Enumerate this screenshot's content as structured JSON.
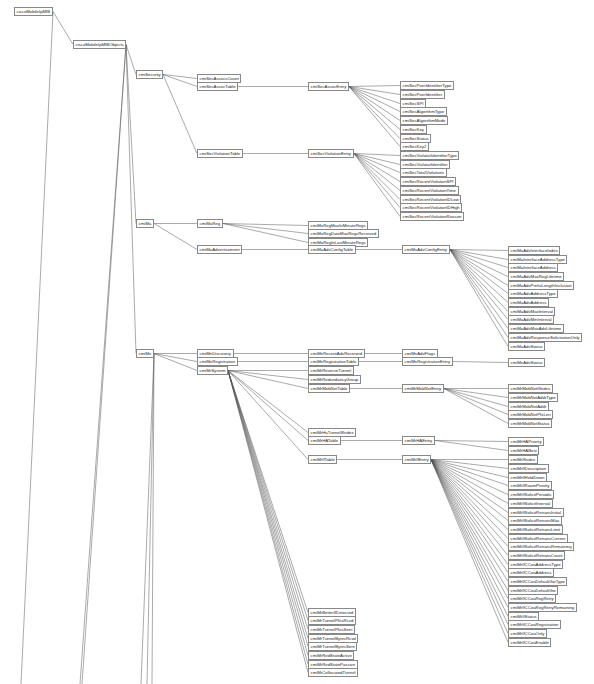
{
  "diagram": {
    "title": "ciscoMobileIpMIB",
    "line_color": "#555555",
    "node_border_color": "#888888",
    "nodes": [
      {
        "id": "root",
        "label": "ciscoMobileIpMIB",
        "x": 14,
        "y": 7,
        "parent": null
      },
      {
        "id": "objs",
        "label": "ciscoMobileIpMIBObjects",
        "x": 73,
        "y": 40,
        "parent": "root"
      },
      {
        "id": "sec",
        "label": "cmiSecurity",
        "x": 136,
        "y": 70,
        "parent": "objs"
      },
      {
        "id": "assocCount",
        "label": "cmiSecAssocsCount",
        "x": 197,
        "y": 74,
        "parent": "sec"
      },
      {
        "id": "assocTable",
        "label": "cmiSecAssocTable",
        "x": 197,
        "y": 82,
        "parent": "sec"
      },
      {
        "id": "assocEntry",
        "label": "cmiSecAssocEntry",
        "x": 308,
        "y": 82,
        "parent": "assocTable"
      },
      {
        "id": "a1",
        "label": "cmiSecPeerIdentifierType",
        "x": 400,
        "y": 81,
        "parent": "assocEntry"
      },
      {
        "id": "a2",
        "label": "cmiSecPeerIdentifier",
        "x": 400,
        "y": 90,
        "parent": "assocEntry"
      },
      {
        "id": "a3",
        "label": "cmiSecSPI",
        "x": 400,
        "y": 99,
        "parent": "assocEntry"
      },
      {
        "id": "a4",
        "label": "cmiSecAlgorithmType",
        "x": 400,
        "y": 107,
        "parent": "assocEntry"
      },
      {
        "id": "a5",
        "label": "cmiSecAlgorithmMode",
        "x": 400,
        "y": 116,
        "parent": "assocEntry"
      },
      {
        "id": "a6",
        "label": "cmiSecKey",
        "x": 400,
        "y": 125,
        "parent": "assocEntry"
      },
      {
        "id": "a7",
        "label": "cmiSecStatus",
        "x": 400,
        "y": 134,
        "parent": "assocEntry"
      },
      {
        "id": "a8",
        "label": "cmiSecKey2",
        "x": 400,
        "y": 142,
        "parent": "assocEntry"
      },
      {
        "id": "violTable",
        "label": "cmiSecViolationTable",
        "x": 197,
        "y": 149,
        "parent": "sec"
      },
      {
        "id": "violEntry",
        "label": "cmiSecViolationEntry",
        "x": 308,
        "y": 149,
        "parent": "violTable"
      },
      {
        "id": "v1",
        "label": "cmiSecViolatorIdentifierType",
        "x": 400,
        "y": 151,
        "parent": "violEntry"
      },
      {
        "id": "v2",
        "label": "cmiSecViolatorIdentifier",
        "x": 400,
        "y": 160,
        "parent": "violEntry"
      },
      {
        "id": "v3",
        "label": "cmiSecTotalViolations",
        "x": 400,
        "y": 168,
        "parent": "violEntry"
      },
      {
        "id": "v4",
        "label": "cmiSecRecentViolationSPI",
        "x": 400,
        "y": 177,
        "parent": "violEntry"
      },
      {
        "id": "v5",
        "label": "cmiSecRecentViolationTime",
        "x": 400,
        "y": 186,
        "parent": "violEntry"
      },
      {
        "id": "v6",
        "label": "cmiSecRecentViolationIDLow",
        "x": 400,
        "y": 195,
        "parent": "violEntry"
      },
      {
        "id": "v7",
        "label": "cmiSecRecentViolationIDHigh",
        "x": 400,
        "y": 203,
        "parent": "violEntry"
      },
      {
        "id": "v8",
        "label": "cmiSecRecentViolationReason",
        "x": 400,
        "y": 212,
        "parent": "violEntry"
      },
      {
        "id": "ma",
        "label": "cmiMa",
        "x": 136,
        "y": 219,
        "parent": "objs"
      },
      {
        "id": "maReg",
        "label": "cmiMaReg",
        "x": 197,
        "y": 219,
        "parent": "ma"
      },
      {
        "id": "r1",
        "label": "cmiMaRegMaxInMinuteRegs",
        "x": 308,
        "y": 221,
        "parent": "maReg"
      },
      {
        "id": "r2",
        "label": "cmiMaRegDateMaxRegsReceived",
        "x": 308,
        "y": 229,
        "parent": "maReg"
      },
      {
        "id": "r3",
        "label": "cmiMaRegInLastMinuteRegs",
        "x": 308,
        "y": 238,
        "parent": "maReg"
      },
      {
        "id": "maAdv",
        "label": "cmiMaAdvertisement",
        "x": 197,
        "y": 245,
        "parent": "ma"
      },
      {
        "id": "advTable",
        "label": "cmiMaAdvConfigTable",
        "x": 308,
        "y": 245,
        "parent": "maAdv"
      },
      {
        "id": "advEntry",
        "label": "cmiMaAdvConfigEntry",
        "x": 402,
        "y": 245,
        "parent": "advTable"
      },
      {
        "id": "ad1",
        "label": "cmiMaAdvInterfaceIndex",
        "x": 508,
        "y": 246,
        "parent": "advEntry"
      },
      {
        "id": "ad2",
        "label": "cmiMaInterfaceAddressType",
        "x": 508,
        "y": 255,
        "parent": "advEntry"
      },
      {
        "id": "ad3",
        "label": "cmiMaInterfaceAddress",
        "x": 508,
        "y": 263,
        "parent": "advEntry"
      },
      {
        "id": "ad4",
        "label": "cmiMaAdvMaxRegLifetime",
        "x": 508,
        "y": 272,
        "parent": "advEntry"
      },
      {
        "id": "ad5",
        "label": "cmiMaAdvPrefixLengthInclusion",
        "x": 508,
        "y": 281,
        "parent": "advEntry"
      },
      {
        "id": "ad6",
        "label": "cmiMaAdvAddressType",
        "x": 508,
        "y": 289,
        "parent": "advEntry"
      },
      {
        "id": "ad7",
        "label": "cmiMaAdvAddress",
        "x": 508,
        "y": 298,
        "parent": "advEntry"
      },
      {
        "id": "ad8",
        "label": "cmiMaAdvMaxInterval",
        "x": 508,
        "y": 307,
        "parent": "advEntry"
      },
      {
        "id": "ad9",
        "label": "cmiMaAdvMinInterval",
        "x": 508,
        "y": 315,
        "parent": "advEntry"
      },
      {
        "id": "ad10",
        "label": "cmiMaAdvMaxAdvLifetime",
        "x": 508,
        "y": 324,
        "parent": "advEntry"
      },
      {
        "id": "ad11",
        "label": "cmiMaAdvResponseSolicitationOnly",
        "x": 508,
        "y": 333,
        "parent": "advEntry"
      },
      {
        "id": "ad12",
        "label": "cmiMaAdvStatus",
        "x": 508,
        "y": 342,
        "parent": "advEntry"
      },
      {
        "id": "mn",
        "label": "cmiMn",
        "x": 136,
        "y": 349,
        "parent": "objs"
      },
      {
        "id": "mnDisc",
        "label": "cmiMnDiscovery",
        "x": 197,
        "y": 349,
        "parent": "mn"
      },
      {
        "id": "mnDisc1",
        "label": "cmiMnRecentAdvReceived",
        "x": 308,
        "y": 349,
        "parent": "mnDisc"
      },
      {
        "id": "mnDisc2",
        "label": "cmiMnAdvFlags",
        "x": 402,
        "y": 349,
        "parent": "mnDisc1"
      },
      {
        "id": "mnReg",
        "label": "cmiMnRegistration",
        "x": 197,
        "y": 357,
        "parent": "mn"
      },
      {
        "id": "mnRegTable",
        "label": "cmiMnRegistrationTable",
        "x": 308,
        "y": 357,
        "parent": "mnReg"
      },
      {
        "id": "mnRegEntry",
        "label": "cmiMnRegistrationEntry",
        "x": 402,
        "y": 357,
        "parent": "mnRegTable"
      },
      {
        "id": "mnRegStatus",
        "label": "cmiMnAdvStatus",
        "x": 508,
        "y": 358,
        "parent": "mnRegEntry"
      },
      {
        "id": "mnSys",
        "label": "cmiMrSystem",
        "x": 197,
        "y": 366,
        "parent": "mn"
      },
      {
        "id": "s1",
        "label": "cmiMrReverseTunnel",
        "x": 308,
        "y": 366,
        "parent": "mnSys"
      },
      {
        "id": "s2",
        "label": "cmiMrRedundancyGroup",
        "x": 308,
        "y": 375,
        "parent": "mnSys"
      },
      {
        "id": "s3",
        "label": "cmiMrMobNetTable",
        "x": 308,
        "y": 384,
        "parent": "mnSys"
      },
      {
        "id": "mobEntry",
        "label": "cmiMrMobNetEntry",
        "x": 402,
        "y": 384,
        "parent": "s3"
      },
      {
        "id": "m1",
        "label": "cmiMrMobNetIfIndex",
        "x": 508,
        "y": 384,
        "parent": "mobEntry"
      },
      {
        "id": "m2",
        "label": "cmiMrMobNetAddrType",
        "x": 508,
        "y": 393,
        "parent": "mobEntry"
      },
      {
        "id": "m3",
        "label": "cmiMrMobNetAddr",
        "x": 508,
        "y": 402,
        "parent": "mobEntry"
      },
      {
        "id": "m4",
        "label": "cmiMrMobNetPfxLen",
        "x": 508,
        "y": 410,
        "parent": "mobEntry"
      },
      {
        "id": "m5",
        "label": "cmiMrMobNetStatus",
        "x": 508,
        "y": 419,
        "parent": "mobEntry"
      },
      {
        "id": "s4",
        "label": "cmiMrHaTunnelIfIndex",
        "x": 308,
        "y": 428,
        "parent": "mnSys"
      },
      {
        "id": "s5",
        "label": "cmiMrHATable",
        "x": 308,
        "y": 436,
        "parent": "mnSys"
      },
      {
        "id": "haEntry",
        "label": "cmiMrHAEntry",
        "x": 402,
        "y": 436,
        "parent": "s5"
      },
      {
        "id": "h1",
        "label": "cmiMrHAPriority",
        "x": 508,
        "y": 437,
        "parent": "haEntry"
      },
      {
        "id": "h2",
        "label": "cmiMrHABest",
        "x": 508,
        "y": 446,
        "parent": "haEntry"
      },
      {
        "id": "s6",
        "label": "cmiMrIfTable",
        "x": 308,
        "y": 455,
        "parent": "mnSys"
      },
      {
        "id": "ifEntry",
        "label": "cmiMrIfEntry",
        "x": 402,
        "y": 455,
        "parent": "s6"
      },
      {
        "id": "i1",
        "label": "cmiMrIfIndex",
        "x": 508,
        "y": 455,
        "parent": "ifEntry"
      },
      {
        "id": "i2",
        "label": "cmiMrIfDescription",
        "x": 508,
        "y": 464,
        "parent": "ifEntry"
      },
      {
        "id": "i3",
        "label": "cmiMrIfHoldDown",
        "x": 508,
        "y": 473,
        "parent": "ifEntry"
      },
      {
        "id": "i4",
        "label": "cmiMrIfRoamPriority",
        "x": 508,
        "y": 481,
        "parent": "ifEntry"
      },
      {
        "id": "i5",
        "label": "cmiMrIfSolicitPeriodic",
        "x": 508,
        "y": 490,
        "parent": "ifEntry"
      },
      {
        "id": "i6",
        "label": "cmiMrIfSolicitInterval",
        "x": 508,
        "y": 499,
        "parent": "ifEntry"
      },
      {
        "id": "i7",
        "label": "cmiMrIfSolicitRetransInitial",
        "x": 508,
        "y": 508,
        "parent": "ifEntry"
      },
      {
        "id": "i8",
        "label": "cmiMrIfSolicitRetransMax",
        "x": 508,
        "y": 516,
        "parent": "ifEntry"
      },
      {
        "id": "i9",
        "label": "cmiMrIfSolicitRetransLimit",
        "x": 508,
        "y": 525,
        "parent": "ifEntry"
      },
      {
        "id": "i10",
        "label": "cmiMrIfSolicitRetransCurrent",
        "x": 508,
        "y": 534,
        "parent": "ifEntry"
      },
      {
        "id": "i11",
        "label": "cmiMrIfSolicitRetransRemaining",
        "x": 508,
        "y": 542,
        "parent": "ifEntry"
      },
      {
        "id": "i12",
        "label": "cmiMrIfSolicitRetransCount",
        "x": 508,
        "y": 551,
        "parent": "ifEntry"
      },
      {
        "id": "i13",
        "label": "cmiMrIfCCoaAddressType",
        "x": 508,
        "y": 560,
        "parent": "ifEntry"
      },
      {
        "id": "i14",
        "label": "cmiMrIfCCoaAddress",
        "x": 508,
        "y": 568,
        "parent": "ifEntry"
      },
      {
        "id": "i15",
        "label": "cmiMrIfCCoaDefaultGwType",
        "x": 508,
        "y": 577,
        "parent": "ifEntry"
      },
      {
        "id": "i16",
        "label": "cmiMrIfCCoaDefaultGw",
        "x": 508,
        "y": 586,
        "parent": "ifEntry"
      },
      {
        "id": "i17",
        "label": "cmiMrIfCCoaRegRetry",
        "x": 508,
        "y": 594,
        "parent": "ifEntry"
      },
      {
        "id": "i18",
        "label": "cmiMrIfCCoaRegRetryRemaining",
        "x": 508,
        "y": 603,
        "parent": "ifEntry"
      },
      {
        "id": "i19",
        "label": "cmiMrIfStatus",
        "x": 508,
        "y": 612,
        "parent": "ifEntry"
      },
      {
        "id": "i20",
        "label": "cmiMrIfCCoaRegistration",
        "x": 508,
        "y": 620,
        "parent": "ifEntry"
      },
      {
        "id": "i21",
        "label": "cmiMrIfCCoaOnly",
        "x": 508,
        "y": 629,
        "parent": "ifEntry"
      },
      {
        "id": "i22",
        "label": "cmiMrIfCCoaEnable",
        "x": 508,
        "y": 638,
        "parent": "ifEntry"
      },
      {
        "id": "s7",
        "label": "cmiMrBetterIfDetected",
        "x": 308,
        "y": 608,
        "parent": "mnSys"
      },
      {
        "id": "s8",
        "label": "cmiMrTunnelPktsRcvd",
        "x": 308,
        "y": 616,
        "parent": "mnSys"
      },
      {
        "id": "s9",
        "label": "cmiMrTunnelPktsSent",
        "x": 308,
        "y": 625,
        "parent": "mnSys"
      },
      {
        "id": "s10",
        "label": "cmiMrTunnelBytesRcvd",
        "x": 308,
        "y": 634,
        "parent": "mnSys"
      },
      {
        "id": "s11",
        "label": "cmiMrTunnelBytesSent",
        "x": 308,
        "y": 642,
        "parent": "mnSys"
      },
      {
        "id": "s12",
        "label": "cmiMrRedStateActive",
        "x": 308,
        "y": 651,
        "parent": "mnSys"
      },
      {
        "id": "s13",
        "label": "cmiMrRedStatePassive",
        "x": 308,
        "y": 660,
        "parent": "mnSys"
      },
      {
        "id": "s14",
        "label": "cmiMrCollocatedTunnel",
        "x": 308,
        "y": 668,
        "parent": "mnSys"
      }
    ],
    "offscreen_edges": [
      {
        "from": "root",
        "to_x": 21,
        "to_y": 684
      },
      {
        "from": "objs",
        "to_x": 80,
        "to_y": 684
      },
      {
        "from": "objs",
        "to_x": 82,
        "to_y": 684
      },
      {
        "from": "mn",
        "to_x": 141,
        "to_y": 684
      },
      {
        "from": "mn",
        "to_x": 147,
        "to_y": 684
      },
      {
        "from": "mn",
        "to_x": 152,
        "to_y": 684
      }
    ]
  }
}
